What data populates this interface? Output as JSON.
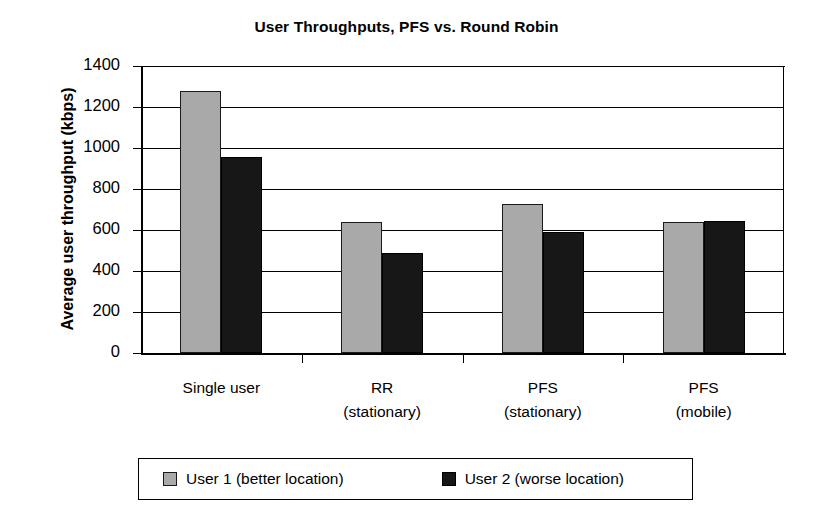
{
  "chart_data": {
    "type": "bar",
    "title": "User Throughputs, PFS vs. Round Robin",
    "xlabel": "",
    "ylabel": "Average user throughput (kbps)",
    "ylim": [
      0,
      1400
    ],
    "ytick_labels": [
      "1400",
      "1200",
      "1000",
      "800",
      "600",
      "400",
      "200",
      "0"
    ],
    "ytick_values": [
      1400,
      1200,
      1000,
      800,
      600,
      400,
      200,
      0
    ],
    "grid": true,
    "legend_position": "bottom",
    "categories": [
      "Single user",
      "RR\n(stationary)",
      "PFS\n(stationary)",
      "PFS\n(mobile)"
    ],
    "category_lines": [
      [
        "Single user",
        ""
      ],
      [
        "RR",
        "(stationary)"
      ],
      [
        "PFS",
        "(stationary)"
      ],
      [
        "PFS",
        "(mobile)"
      ]
    ],
    "series": [
      {
        "name": "User 1 (better location)",
        "color": "#a9a9a9",
        "values": [
          1280,
          640,
          725,
          640
        ]
      },
      {
        "name": "User 2 (worse location)",
        "color": "#171717",
        "values": [
          955,
          490,
          590,
          645
        ]
      }
    ]
  },
  "legend": {
    "entries": [
      {
        "label": "User 1 (better location)"
      },
      {
        "label": "User 2 (worse location)"
      }
    ]
  }
}
